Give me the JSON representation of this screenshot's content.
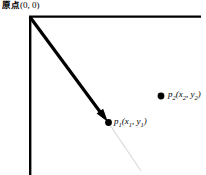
{
  "figure": {
    "title_label": "原点",
    "origin_coords": "(0, 0)",
    "background_color": "#ffffff",
    "stroke_color": "#000000",
    "faint_line_color": "#d8d8d8"
  },
  "labels": {
    "origin": {
      "text": "原点",
      "coords": "(0, 0)"
    },
    "p1": {
      "name": "p",
      "index": "1",
      "open": "(",
      "x_var": "x",
      "x_index": "1",
      "comma": ", ",
      "y_var": "y",
      "y_index": "1",
      "close": ")"
    },
    "p2": {
      "name": "p",
      "index": "2",
      "open": "(",
      "x_var": "x",
      "x_index": "2",
      "comma": ", ",
      "y_var": "y",
      "y_index": "2",
      "close": ")"
    }
  },
  "geometry": {
    "origin": {
      "x": 30,
      "y": 17
    },
    "x_axis_end": {
      "x": 201,
      "y": 17
    },
    "y_axis_end": {
      "x": 30,
      "y": 175
    },
    "p1_point": {
      "x": 108,
      "y": 122
    },
    "p2_point": {
      "x": 161,
      "y": 96
    },
    "faint_line_end": {
      "x": 141,
      "y": 171
    },
    "axis_width": 2.2,
    "arrow_width": 3.2
  }
}
